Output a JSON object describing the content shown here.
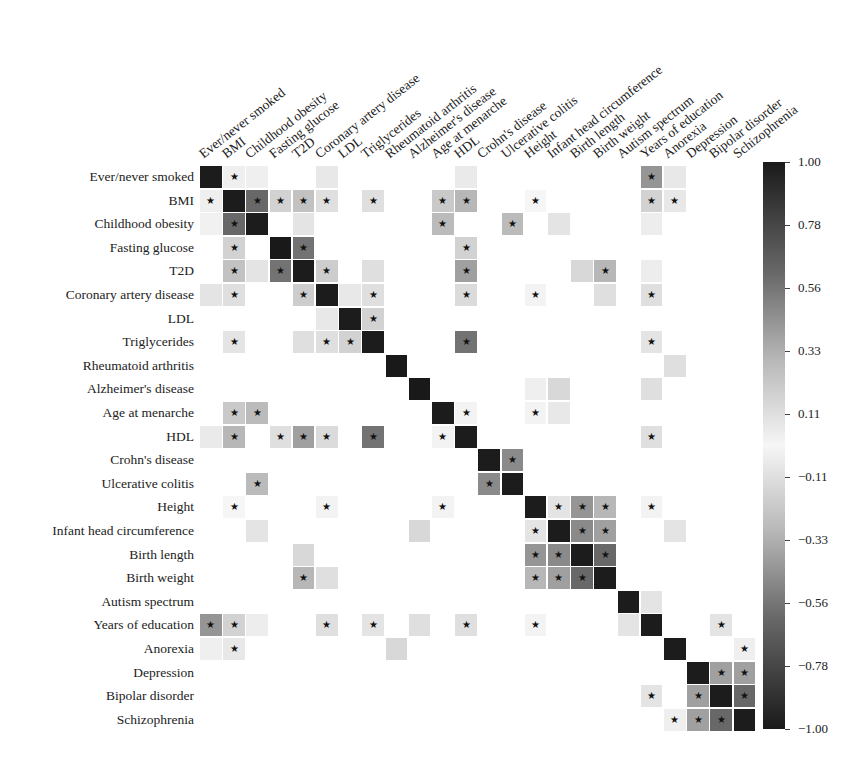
{
  "chart_data": {
    "type": "heatmap",
    "title": "",
    "labels": [
      "Ever/never smoked",
      "BMI",
      "Childhood obesity",
      "Fasting glucose",
      "T2D",
      "Coronary artery disease",
      "LDL",
      "Triglycerides",
      "Rheumatoid arthritis",
      "Alzheimer's disease",
      "Age at menarche",
      "HDL",
      "Crohn's disease",
      "Ulcerative colitis",
      "Height",
      "Infant head circumference",
      "Birth length",
      "Birth weight",
      "Autism spectrum",
      "Years of education",
      "Anorexia",
      "Depression",
      "Bipolar disorder",
      "Schizophrenia"
    ],
    "colorbar": {
      "ticks": [
        "1.00",
        "0.78",
        "0.56",
        "0.33",
        "0.11",
        "-0.11",
        "-0.33",
        "-0.56",
        "-0.78",
        "-1.00"
      ],
      "range": [
        -1,
        1
      ],
      "colormap": "grey diverging (dark = |r| high)"
    },
    "significance_marker": "★",
    "cells": [
      {
        "r": 0,
        "c": 1,
        "v": 0.05,
        "s": true
      },
      {
        "r": 0,
        "c": 2,
        "v": 0.05
      },
      {
        "r": 0,
        "c": 5,
        "v": 0.08
      },
      {
        "r": 0,
        "c": 11,
        "v": 0.07
      },
      {
        "r": 0,
        "c": 19,
        "v": -0.45,
        "s": true
      },
      {
        "r": 0,
        "c": 20,
        "v": 0.08
      },
      {
        "r": 1,
        "c": 0,
        "v": 0.05,
        "s": true
      },
      {
        "r": 1,
        "c": 2,
        "v": 0.65,
        "s": true
      },
      {
        "r": 1,
        "c": 3,
        "v": 0.18,
        "s": true
      },
      {
        "r": 1,
        "c": 4,
        "v": 0.25,
        "s": true
      },
      {
        "r": 1,
        "c": 5,
        "v": 0.12,
        "s": true
      },
      {
        "r": 1,
        "c": 7,
        "v": 0.12,
        "s": true
      },
      {
        "r": 1,
        "c": 10,
        "v": -0.22,
        "s": true
      },
      {
        "r": 1,
        "c": 11,
        "v": -0.3,
        "s": true
      },
      {
        "r": 1,
        "c": 14,
        "v": 0.02,
        "s": true
      },
      {
        "r": 1,
        "c": 19,
        "v": -0.18,
        "s": true
      },
      {
        "r": 1,
        "c": 20,
        "v": -0.08,
        "s": true
      },
      {
        "r": 2,
        "c": 0,
        "v": 0.04
      },
      {
        "r": 2,
        "c": 1,
        "v": 0.65,
        "s": true
      },
      {
        "r": 2,
        "c": 4,
        "v": 0.1
      },
      {
        "r": 2,
        "c": 10,
        "v": -0.28,
        "s": true
      },
      {
        "r": 2,
        "c": 13,
        "v": 0.28,
        "s": true
      },
      {
        "r": 2,
        "c": 15,
        "v": 0.1
      },
      {
        "r": 2,
        "c": 19,
        "v": 0.06
      },
      {
        "r": 3,
        "c": 1,
        "v": 0.18,
        "s": true
      },
      {
        "r": 3,
        "c": 3,
        "v": 1
      },
      {
        "r": 3,
        "c": 4,
        "v": 0.6,
        "s": true
      },
      {
        "r": 3,
        "c": 11,
        "v": -0.18,
        "s": true
      },
      {
        "r": 4,
        "c": 1,
        "v": 0.25,
        "s": true
      },
      {
        "r": 4,
        "c": 2,
        "v": 0.1
      },
      {
        "r": 4,
        "c": 3,
        "v": 0.6,
        "s": true
      },
      {
        "r": 4,
        "c": 5,
        "v": 0.2,
        "s": true
      },
      {
        "r": 4,
        "c": 7,
        "v": 0.12
      },
      {
        "r": 4,
        "c": 11,
        "v": -0.4,
        "s": true
      },
      {
        "r": 4,
        "c": 16,
        "v": -0.15
      },
      {
        "r": 4,
        "c": 17,
        "v": -0.3,
        "s": true
      },
      {
        "r": 4,
        "c": 19,
        "v": 0.06
      },
      {
        "r": 5,
        "c": 0,
        "v": 0.1
      },
      {
        "r": 5,
        "c": 1,
        "v": 0.12,
        "s": true
      },
      {
        "r": 5,
        "c": 4,
        "v": 0.2,
        "s": true
      },
      {
        "r": 5,
        "c": 6,
        "v": 0.08
      },
      {
        "r": 5,
        "c": 7,
        "v": 0.12,
        "s": true
      },
      {
        "r": 5,
        "c": 11,
        "v": -0.14,
        "s": true
      },
      {
        "r": 5,
        "c": 14,
        "v": -0.03,
        "s": true
      },
      {
        "r": 5,
        "c": 17,
        "v": -0.12
      },
      {
        "r": 5,
        "c": 19,
        "v": -0.12,
        "s": true
      },
      {
        "r": 6,
        "c": 5,
        "v": 0.08
      },
      {
        "r": 6,
        "c": 7,
        "v": 0.18,
        "s": true
      },
      {
        "r": 7,
        "c": 1,
        "v": 0.1,
        "s": true
      },
      {
        "r": 7,
        "c": 4,
        "v": 0.12
      },
      {
        "r": 7,
        "c": 5,
        "v": 0.12,
        "s": true
      },
      {
        "r": 7,
        "c": 6,
        "v": 0.18,
        "s": true
      },
      {
        "r": 7,
        "c": 11,
        "v": -0.6,
        "s": true
      },
      {
        "r": 7,
        "c": 19,
        "v": -0.1,
        "s": true
      },
      {
        "r": 8,
        "c": 8,
        "v": 1
      },
      {
        "r": 8,
        "c": 20,
        "v": 0.12
      },
      {
        "r": 9,
        "c": 9,
        "v": 1
      },
      {
        "r": 9,
        "c": 14,
        "v": 0.05
      },
      {
        "r": 9,
        "c": 15,
        "v": 0.15
      },
      {
        "r": 9,
        "c": 19,
        "v": 0.12
      },
      {
        "r": 10,
        "c": 1,
        "v": -0.22,
        "s": true
      },
      {
        "r": 10,
        "c": 2,
        "v": -0.28,
        "s": true
      },
      {
        "r": 10,
        "c": 11,
        "v": 0.03,
        "s": true
      },
      {
        "r": 10,
        "c": 14,
        "v": 0.03,
        "s": true
      },
      {
        "r": 10,
        "c": 15,
        "v": 0.08
      },
      {
        "r": 11,
        "c": 0,
        "v": 0.07
      },
      {
        "r": 11,
        "c": 1,
        "v": -0.3,
        "s": true
      },
      {
        "r": 11,
        "c": 3,
        "v": -0.12,
        "s": true
      },
      {
        "r": 11,
        "c": 4,
        "v": -0.4,
        "s": true
      },
      {
        "r": 11,
        "c": 5,
        "v": -0.14,
        "s": true
      },
      {
        "r": 11,
        "c": 7,
        "v": -0.6,
        "s": true
      },
      {
        "r": 11,
        "c": 10,
        "v": 0.03,
        "s": true
      },
      {
        "r": 11,
        "c": 19,
        "v": 0.12,
        "s": true
      },
      {
        "r": 12,
        "c": 13,
        "v": 0.5,
        "s": true
      },
      {
        "r": 13,
        "c": 2,
        "v": 0.28,
        "s": true
      },
      {
        "r": 13,
        "c": 12,
        "v": 0.5,
        "s": true
      },
      {
        "r": 14,
        "c": 1,
        "v": 0.02,
        "s": true
      },
      {
        "r": 14,
        "c": 5,
        "v": -0.03,
        "s": true
      },
      {
        "r": 14,
        "c": 10,
        "v": 0.03,
        "s": true
      },
      {
        "r": 14,
        "c": 15,
        "v": 0.1,
        "s": true
      },
      {
        "r": 14,
        "c": 16,
        "v": 0.45,
        "s": true
      },
      {
        "r": 14,
        "c": 17,
        "v": 0.3,
        "s": true
      },
      {
        "r": 14,
        "c": 19,
        "v": 0.03,
        "s": true
      },
      {
        "r": 15,
        "c": 2,
        "v": 0.1
      },
      {
        "r": 15,
        "c": 9,
        "v": 0.15
      },
      {
        "r": 15,
        "c": 14,
        "v": 0.1,
        "s": true
      },
      {
        "r": 15,
        "c": 16,
        "v": 0.5,
        "s": true
      },
      {
        "r": 15,
        "c": 17,
        "v": 0.4,
        "s": true
      },
      {
        "r": 15,
        "c": 20,
        "v": 0.1
      },
      {
        "r": 16,
        "c": 4,
        "v": -0.15
      },
      {
        "r": 16,
        "c": 14,
        "v": 0.45,
        "s": true
      },
      {
        "r": 16,
        "c": 15,
        "v": 0.5,
        "s": true
      },
      {
        "r": 16,
        "c": 17,
        "v": 0.65,
        "s": true
      },
      {
        "r": 17,
        "c": 4,
        "v": -0.3,
        "s": true
      },
      {
        "r": 17,
        "c": 5,
        "v": -0.12
      },
      {
        "r": 17,
        "c": 14,
        "v": 0.3,
        "s": true
      },
      {
        "r": 17,
        "c": 15,
        "v": 0.4,
        "s": true
      },
      {
        "r": 17,
        "c": 16,
        "v": 0.65,
        "s": true
      },
      {
        "r": 18,
        "c": 19,
        "v": 0.1
      },
      {
        "r": 19,
        "c": 0,
        "v": -0.45,
        "s": true
      },
      {
        "r": 19,
        "c": 1,
        "v": -0.18,
        "s": true
      },
      {
        "r": 19,
        "c": 2,
        "v": 0.06
      },
      {
        "r": 19,
        "c": 5,
        "v": -0.12,
        "s": true
      },
      {
        "r": 19,
        "c": 7,
        "v": -0.1,
        "s": true
      },
      {
        "r": 19,
        "c": 9,
        "v": 0.12
      },
      {
        "r": 19,
        "c": 11,
        "v": 0.12,
        "s": true
      },
      {
        "r": 19,
        "c": 14,
        "v": 0.03,
        "s": true
      },
      {
        "r": 19,
        "c": 18,
        "v": 0.1
      },
      {
        "r": 19,
        "c": 22,
        "v": 0.1,
        "s": true
      },
      {
        "r": 20,
        "c": 0,
        "v": 0.05
      },
      {
        "r": 20,
        "c": 1,
        "v": -0.08,
        "s": true
      },
      {
        "r": 20,
        "c": 8,
        "v": 0.15
      },
      {
        "r": 20,
        "c": 23,
        "v": 0.05,
        "s": true
      },
      {
        "r": 21,
        "c": 22,
        "v": 0.4,
        "s": true
      },
      {
        "r": 21,
        "c": 23,
        "v": 0.4,
        "s": true
      },
      {
        "r": 22,
        "c": 19,
        "v": 0.1,
        "s": true
      },
      {
        "r": 22,
        "c": 21,
        "v": 0.4,
        "s": true
      },
      {
        "r": 22,
        "c": 23,
        "v": 0.65,
        "s": true
      },
      {
        "r": 23,
        "c": 20,
        "v": 0.05,
        "s": true
      },
      {
        "r": 23,
        "c": 21,
        "v": 0.4,
        "s": true
      },
      {
        "r": 23,
        "c": 22,
        "v": 0.65,
        "s": true
      }
    ]
  }
}
